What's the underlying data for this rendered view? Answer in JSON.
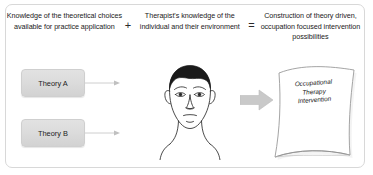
{
  "diagram": {
    "border_color": "#d8d8d8",
    "background": "#ffffff",
    "header": {
      "columns": [
        {
          "id": "theoretical-knowledge",
          "text": "Knowledge of the theoretical choices available for practice application"
        },
        {
          "id": "therapist-knowledge",
          "text": "Therapist's knowledge of the individual and their environment"
        },
        {
          "id": "construction-result",
          "text": "Construction of theory driven, occupation focused intervention possibilities"
        }
      ],
      "operators": [
        {
          "id": "plus",
          "symbol": "+"
        },
        {
          "id": "equals",
          "symbol": "="
        }
      ]
    },
    "theory_boxes": [
      {
        "id": "theory-a",
        "label": "Theory A",
        "fill": "#dcdcdc",
        "border": "#cfcfcf"
      },
      {
        "id": "theory-b",
        "label": "Theory B",
        "fill": "#dcdcdc",
        "border": "#cfcfcf"
      }
    ],
    "connectors": [
      {
        "id": "arrow-theory-a",
        "icon": "thin-arrow-right",
        "color": "#bdbdbd"
      },
      {
        "id": "arrow-theory-b",
        "icon": "thin-arrow-right",
        "color": "#bdbdbd"
      }
    ],
    "person": {
      "id": "therapist-face",
      "icon": "line-art-face",
      "hair_color": "#1a1a1a",
      "outline_color": "#2b2b2b"
    },
    "block_arrow": {
      "id": "result-arrow",
      "icon": "block-arrow-right",
      "color": "#c9c9c9"
    },
    "document": {
      "id": "intervention-page",
      "icon": "curved-page",
      "label_lines": [
        "Occupational",
        "Therapy",
        "Intervention"
      ],
      "label": "Occupational Therapy Intervention",
      "outline_color": "#9a9a9a",
      "fill": "#ffffff"
    }
  }
}
